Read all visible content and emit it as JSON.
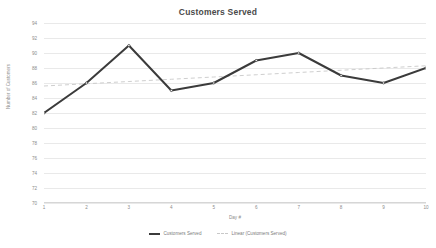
{
  "chart_data": {
    "type": "line",
    "title": "Customers Served",
    "xlabel": "Day #",
    "ylabel": "Number of Customers",
    "x": [
      1,
      2,
      3,
      4,
      5,
      6,
      7,
      8,
      9,
      10
    ],
    "categories": [
      "1",
      "2",
      "3",
      "4",
      "5",
      "6",
      "7",
      "8",
      "9",
      "10"
    ],
    "xlim": [
      1,
      10
    ],
    "ylim": [
      70,
      94
    ],
    "yticks": [
      70,
      72,
      74,
      76,
      78,
      80,
      82,
      84,
      86,
      88,
      90,
      92,
      94
    ],
    "ytick_labels": [
      "70",
      "72",
      "74",
      "76",
      "78",
      "80",
      "82",
      "84",
      "86",
      "88",
      "90",
      "92",
      "94"
    ],
    "grid": true,
    "legend_position": "bottom",
    "series": [
      {
        "name": "Customers Served",
        "type": "line",
        "style": "solid",
        "color": "#3b3b3b",
        "values": [
          82,
          86,
          91,
          85,
          86,
          89,
          90,
          87,
          86,
          88
        ]
      },
      {
        "name": "Linear (Customers Served)",
        "type": "trendline",
        "style": "dashed",
        "color": "#c8c8c8",
        "values": [
          85.6,
          85.9,
          86.2,
          86.5,
          86.8,
          87.1,
          87.4,
          87.7,
          88.0,
          88.3
        ]
      }
    ]
  },
  "legend": {
    "entries": [
      {
        "label": "Customers Served"
      },
      {
        "label": "Linear (Customers Served)"
      }
    ]
  }
}
